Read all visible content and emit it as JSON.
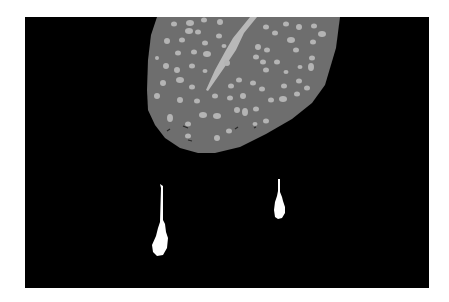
{
  "image": {
    "description": "Grayscale segmentation-style image: a textured gray leaf-like region with lighter spots and a light diagonal spike at top center, plus two white droplet/teardrop shapes with thin stalks below, on a black background framed by a white margin.",
    "colors": {
      "margin": "#ffffff",
      "background": "#000000",
      "leaf": "#6e6e6e",
      "spots": "#b4b4b4",
      "spike": "#b8b8b8",
      "droplets": "#ffffff",
      "dark_marks": "#2a2a2a"
    },
    "objects": [
      {
        "name": "leaf-region",
        "label": "textured gray region"
      },
      {
        "name": "spike",
        "label": "light diagonal spike"
      },
      {
        "name": "droplet-left",
        "label": "white teardrop with long stalk"
      },
      {
        "name": "droplet-right",
        "label": "white teardrop with short stalk"
      }
    ]
  }
}
